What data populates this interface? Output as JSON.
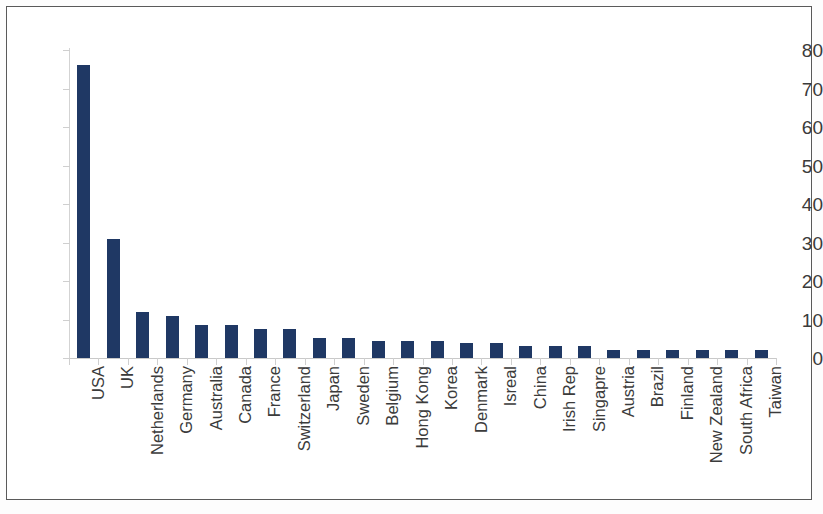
{
  "chart_data": {
    "type": "bar",
    "title": "",
    "subtitle": "",
    "xlabel": "",
    "ylabel": "",
    "ylim": [
      0,
      80
    ],
    "ytick_values": [
      0,
      10,
      20,
      30,
      40,
      50,
      60,
      70,
      80
    ],
    "ytick_labels": [
      "0",
      "10",
      "20",
      "30",
      "40",
      "50",
      "60",
      "70",
      "80"
    ],
    "grid": false,
    "legend": null,
    "bar_color": "#1f3864",
    "axis_color": "#cfcfcf",
    "categories": [
      "USA",
      "UK",
      "Netherlands",
      "Germany",
      "Australia",
      "Canada",
      "France",
      "Switzerland",
      "Japan",
      "Sweden",
      "Belgium",
      "Hong Kong",
      "Korea",
      "Denmark",
      "Isreal",
      "China",
      "Irish Rep",
      "Singapre",
      "Austria",
      "Brazil",
      "Finland",
      "New Zealand",
      "South Africa",
      "Taiwan"
    ],
    "values": [
      76,
      31,
      12,
      11,
      8.5,
      8.5,
      7.5,
      7.5,
      5.2,
      5.2,
      4.4,
      4.4,
      4.4,
      3.8,
      3.8,
      3,
      3,
      3,
      2,
      2.1,
      2.1,
      2.1,
      2.1,
      2
    ]
  }
}
